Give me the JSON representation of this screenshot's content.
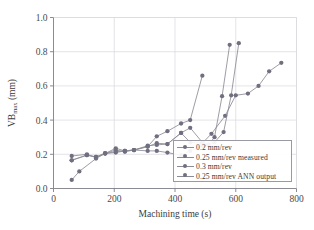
{
  "chart_data": {
    "type": "line",
    "title": "",
    "xlabel": "Machining time (s)",
    "ylabel": "VB",
    "ylabel_sub": "max",
    "ylabel_unit": " (mm)",
    "xlim": [
      0,
      800
    ],
    "ylim": [
      0.0,
      1.0
    ],
    "xticks": [
      0,
      200,
      400,
      600,
      800
    ],
    "yticks": [
      "0.0",
      "0.2",
      "0.4",
      "0.6",
      "0.8",
      "1.0"
    ],
    "ytick_values": [
      0.0,
      0.2,
      0.4,
      0.6,
      0.8,
      1.0
    ],
    "grid": true,
    "legend_position": "lower right",
    "marker_color": "#6f6f80",
    "line_color": "#8b8b96",
    "grid_color": "#d8d8de",
    "axis_color": "#7e7e88",
    "series": [
      {
        "name": "0.2 mm/rev",
        "x": [
          60,
          110,
          140,
          170,
          205,
          235,
          265,
          310,
          340,
          375,
          420,
          450,
          490,
          520,
          565,
          600,
          640,
          675,
          710,
          750
        ],
        "y": [
          0.19,
          0.2,
          0.18,
          0.205,
          0.225,
          0.215,
          0.225,
          0.25,
          0.255,
          0.26,
          0.325,
          0.27,
          0.265,
          0.32,
          0.425,
          0.545,
          0.555,
          0.6,
          0.685,
          0.735
        ]
      },
      {
        "name": "0.25 mm/rev measured",
        "x": [
          60,
          110,
          140,
          170,
          205,
          235,
          265,
          310,
          340,
          375,
          420,
          450,
          490
        ],
        "y": [
          0.165,
          0.195,
          0.185,
          0.205,
          0.21,
          0.22,
          0.225,
          0.245,
          0.305,
          0.335,
          0.38,
          0.4,
          0.66
        ]
      },
      {
        "name": "0.3 mm/rev",
        "x": [
          60,
          110,
          140,
          170,
          205,
          235,
          265,
          310,
          340,
          375,
          420,
          450,
          490,
          510,
          530,
          555,
          580
        ],
        "y": [
          0.165,
          0.195,
          0.185,
          0.205,
          0.235,
          0.22,
          0.225,
          0.245,
          0.265,
          0.26,
          0.325,
          0.355,
          0.27,
          0.255,
          0.3,
          0.54,
          0.84
        ]
      },
      {
        "name": "0.25 mm/rev ANN output",
        "x": [
          60,
          85,
          140,
          170,
          205,
          235,
          265,
          310,
          340,
          375,
          420,
          450,
          490,
          510,
          530,
          560,
          585,
          610
        ],
        "y": [
          0.05,
          0.1,
          0.175,
          0.205,
          0.215,
          0.22,
          0.225,
          0.22,
          0.22,
          0.21,
          0.195,
          0.22,
          0.25,
          0.255,
          0.27,
          0.33,
          0.545,
          0.85
        ]
      }
    ],
    "legend": [
      {
        "label": "0.2 mm/rev"
      },
      {
        "label": "0.25 mm/rev measured"
      },
      {
        "label": "0.3 mm/rev"
      },
      {
        "label": "0.25 mm/rev ANN output"
      }
    ]
  }
}
